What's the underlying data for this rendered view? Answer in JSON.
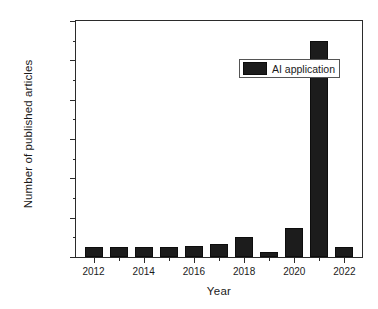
{
  "chart_data": {
    "type": "bar",
    "title": "",
    "subtitle": "",
    "xlabel": "Year",
    "ylabel": "Number of published articles",
    "categories": [
      2012,
      2013,
      2014,
      2015,
      2016,
      2017,
      2018,
      2019,
      2020,
      2022,
      2021
    ],
    "series": [
      {
        "name": "AI application",
        "color": "#1c1c1c",
        "values": [
          50000,
          50000,
          50000,
          50000,
          55000,
          65000,
          100000,
          25000,
          150000,
          1100000,
          50000
        ]
      }
    ],
    "x": [
      2012,
      2013,
      2014,
      2015,
      2016,
      2017,
      2018,
      2019,
      2020,
      2021,
      2022
    ],
    "values": [
      50000,
      50000,
      50000,
      50000,
      55000,
      65000,
      100000,
      25000,
      150000,
      1100000,
      50000
    ],
    "xlim": [
      2011.3,
      2022.7
    ],
    "ylim": [
      0,
      1200000
    ],
    "ytick_values": [
      0,
      200000,
      400000,
      600000,
      800000,
      1000000,
      1200000
    ],
    "ytick_labels": [
      "0.0",
      "2.0x10",
      "4.0x10",
      "6.0x10",
      "8.0x10",
      "1.0x10",
      "1.2x10"
    ],
    "ytick_exponents": [
      "",
      "5",
      "5",
      "5",
      "5",
      "6",
      "6"
    ],
    "xtick_values": [
      2012,
      2014,
      2016,
      2018,
      2020,
      2022
    ],
    "xtick_labels": [
      "2012",
      "2014",
      "2016",
      "2018",
      "2020",
      "2022"
    ],
    "grid": false,
    "legend": {
      "position": "top-center",
      "entries": [
        {
          "label": "AI application",
          "color": "#1c1c1c"
        }
      ]
    },
    "minor_ticks_y": 1,
    "minor_ticks_x": 1
  },
  "legend": {
    "label": "AI application"
  },
  "axes": {
    "x_title": "Year",
    "y_title": "Number of published articles"
  }
}
